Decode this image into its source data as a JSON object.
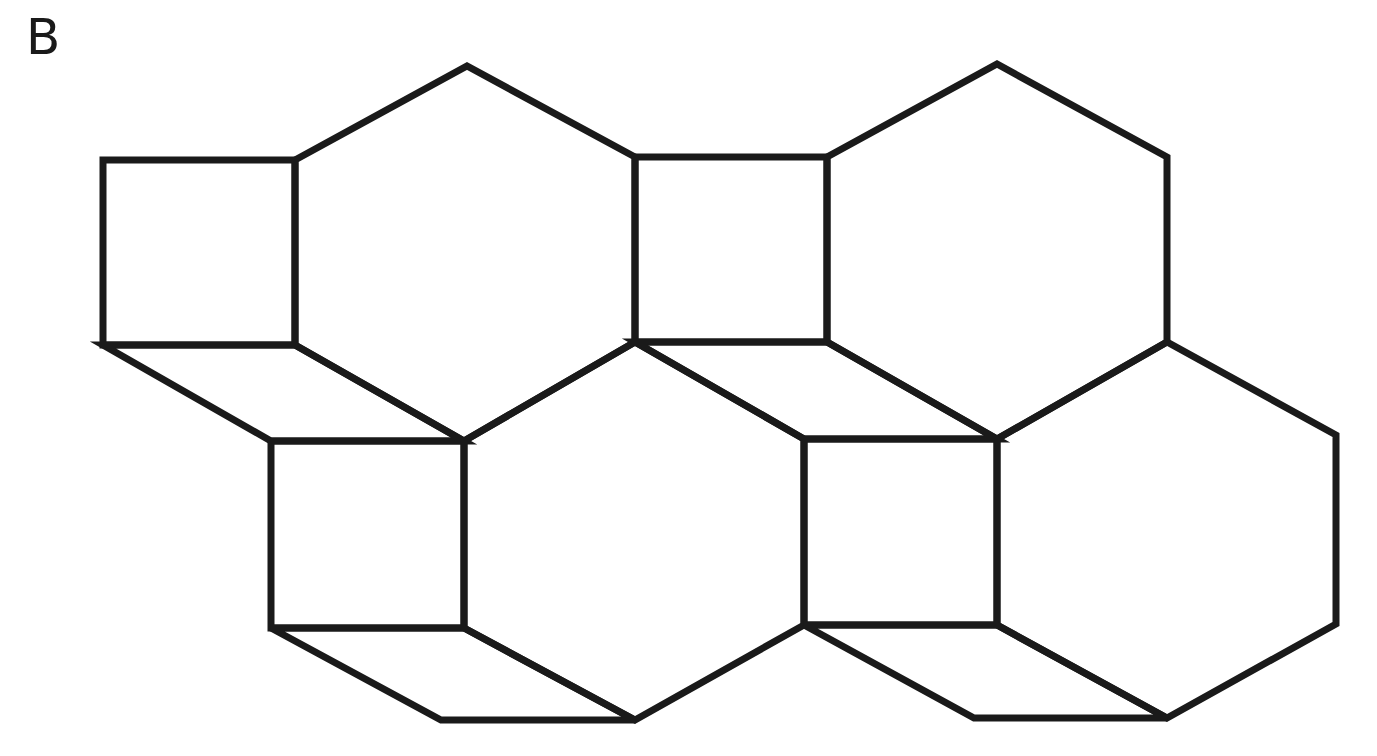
{
  "figure": {
    "panel_label": "B",
    "stroke_color": "#1a1a1a",
    "background": "#ffffff"
  },
  "shapes": {
    "squares": [
      {
        "id": "sq1",
        "points": "103,160 295,160 295,345 103,345"
      },
      {
        "id": "sq2",
        "points": "635,157 827,157 827,342 635,342"
      },
      {
        "id": "sq3",
        "points": "271,441 464,441 464,628 271,628"
      },
      {
        "id": "sq4",
        "points": "804,439 997,439 997,625 804,625"
      }
    ],
    "hexagons": [
      {
        "id": "hx1",
        "points": "295,160 467,66 635,157 635,342 464,441 295,345"
      },
      {
        "id": "hx2",
        "points": "827,157 997,64 1167,157 1167,342 997,439 827,342"
      },
      {
        "id": "hx3",
        "points": "464,441 635,342 804,439 804,625 635,720 464,628"
      },
      {
        "id": "hx4",
        "points": "997,439 1167,342 1336,435 1336,624 1167,718 997,625"
      }
    ],
    "rhombi": [
      {
        "id": "rh1",
        "points": "103,345 295,345 464,441 271,441"
      },
      {
        "id": "rh2",
        "points": "635,342 827,342 997,439 804,439"
      },
      {
        "id": "rh3",
        "points": "271,628 464,628 635,720 441,720"
      },
      {
        "id": "rh4",
        "points": "804,625 997,625 1167,718 974,718"
      }
    ]
  }
}
